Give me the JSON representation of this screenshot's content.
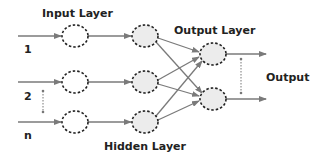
{
  "diagram": {
    "title_labels": {
      "input_layer": "Input Layer",
      "hidden_layer": "Hidden Layer",
      "output_layer": "Output Layer",
      "output": "Output"
    },
    "inputs": [
      {
        "label": "1"
      },
      {
        "label": "2"
      },
      {
        "label": "n"
      }
    ],
    "colors": {
      "arrow": "#7a7a7a",
      "node_border": "#222222",
      "input_node_fill": "#ffffff",
      "hidden_node_fill": "#ececec",
      "output_node_fill": "#ececec",
      "text": "#222222"
    }
  }
}
